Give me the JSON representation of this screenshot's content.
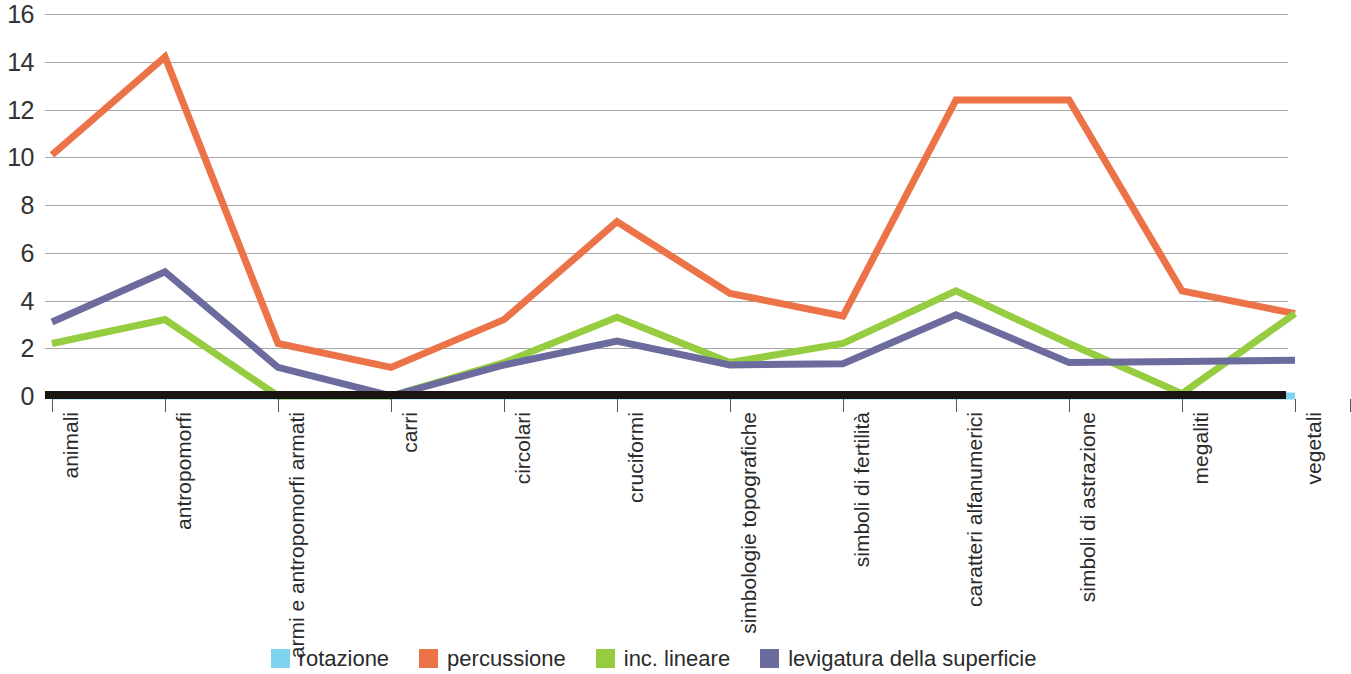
{
  "chart_data": {
    "type": "line",
    "title": "",
    "xlabel": "",
    "ylabel": "",
    "ylim": [
      0,
      16
    ],
    "yticks": [
      0,
      2,
      4,
      6,
      8,
      10,
      12,
      14,
      16
    ],
    "grid": true,
    "legend_position": "bottom",
    "categories": [
      "animali",
      "antropomorfi",
      "armi e antropomorfi armati",
      "carri",
      "circolari",
      "cruciformi",
      "simbologie topografiche",
      "simboli di fertilità",
      "caratteri alfanumerici",
      "simboli di astrazione",
      "megaliti",
      "vegetali"
    ],
    "series": [
      {
        "name": "rotazione",
        "color": "#7ed4ee",
        "values": [
          0,
          0,
          0,
          0,
          0,
          0,
          0,
          0,
          0,
          0,
          0,
          0
        ]
      },
      {
        "name": "percussione",
        "color": "#ec7348",
        "values": [
          10.1,
          14.2,
          2.2,
          1.2,
          3.2,
          7.3,
          4.3,
          3.35,
          12.4,
          12.4,
          4.4,
          3.45
        ]
      },
      {
        "name": "inc. lineare",
        "color": "#96cc3f",
        "values": [
          2.2,
          3.2,
          0,
          0,
          1.4,
          3.3,
          1.4,
          2.2,
          4.4,
          2.2,
          0.1,
          3.45
        ]
      },
      {
        "name": "levigatura della superficie",
        "color": "#6b6b9e",
        "values": [
          3.1,
          5.2,
          1.2,
          0,
          1.3,
          2.3,
          1.3,
          1.35,
          3.4,
          1.4,
          1.45,
          1.5
        ]
      }
    ]
  },
  "legend": {
    "items": [
      {
        "label": "rotazione",
        "color": "#7ed4ee"
      },
      {
        "label": "percussione",
        "color": "#ec7348"
      },
      {
        "label": "inc. lineare",
        "color": "#96cc3f"
      },
      {
        "label": "levigatura della superficie",
        "color": "#6b6b9e"
      }
    ]
  },
  "axis": {
    "y_tick_labels": [
      "16",
      "14",
      "12",
      "10",
      "8",
      "6",
      "4",
      "2",
      "0"
    ],
    "baseline_color": "#1a1410",
    "gridline_color": "#8a8a8a"
  }
}
